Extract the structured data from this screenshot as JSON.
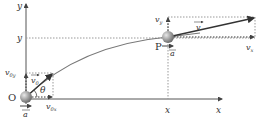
{
  "diagram": {
    "axes": {
      "x_label": "x",
      "y_label": "y"
    },
    "origin": {
      "label": "O"
    },
    "point": {
      "label": "P",
      "x_label": "x",
      "y_label": "y"
    },
    "initial_velocity": {
      "v0_label": "v",
      "v0_sub": "0",
      "v0x_label": "v",
      "v0x_sub": "0x",
      "v0y_label": "v",
      "v0y_sub": "0y",
      "angle_label": "θ"
    },
    "velocity_at_p": {
      "v_label": "v",
      "vx_label": "v",
      "vx_sub": "x",
      "vy_label": "v",
      "vy_sub": "y"
    },
    "acceleration": {
      "label": "a"
    },
    "colors": {
      "axis": "#555555",
      "trajectory": "#666666",
      "vector": "#3a3a3a",
      "dotted": "#999999",
      "ball": "#8a8a8a"
    }
  }
}
